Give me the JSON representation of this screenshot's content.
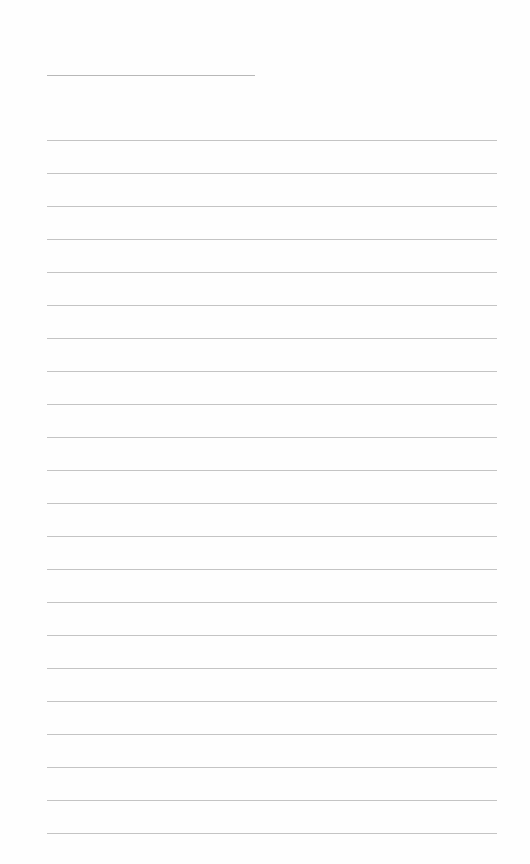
{
  "document": {
    "type": "lined-paper",
    "background_color": "#fefefe",
    "line_color": "#c4c4c4",
    "header_line": {
      "x": 47,
      "y": 75,
      "width": 208
    },
    "rules": {
      "count": 22,
      "start_y": 140,
      "spacing": 33,
      "x": 47,
      "width": 450
    }
  }
}
